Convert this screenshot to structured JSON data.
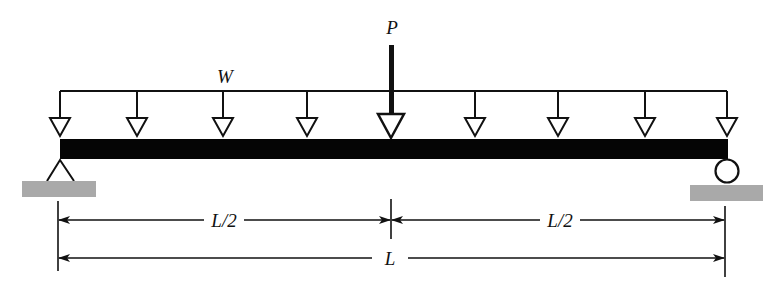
{
  "diagram": {
    "type": "simply-supported-beam",
    "labels": {
      "point_load": "P",
      "distributed_load": "W",
      "left_half": "L/2",
      "right_half": "L/2",
      "total_length": "L"
    },
    "supports": {
      "left": "pin-support",
      "right": "roller-support"
    },
    "distributed_load_arrow_count": 9,
    "colors": {
      "ink": "#111111",
      "beam": "#050505",
      "ground": "#a9a9a9",
      "background": "#ffffff"
    }
  }
}
